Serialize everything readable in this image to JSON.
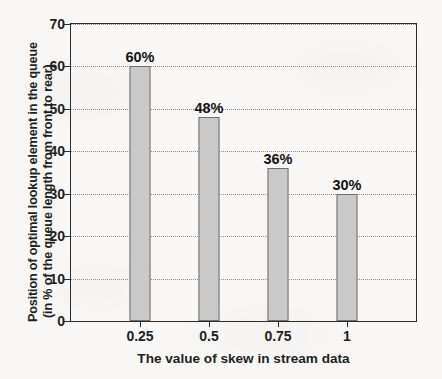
{
  "chart_data": {
    "type": "bar",
    "title": "",
    "categories": [
      "0.25",
      "0.5",
      "0.75",
      "1"
    ],
    "values": [
      60,
      48,
      36,
      30
    ],
    "data_labels": [
      "60%",
      "48%",
      "36%",
      "30%"
    ],
    "xlabel": "The value of skew in stream data",
    "ylabel_line1": "Position of optimal lookup element in the queue",
    "ylabel_line2": "(in % of the queue length from front to rear)",
    "ylim": [
      0,
      70
    ],
    "yticks": [
      0,
      10,
      20,
      30,
      40,
      50,
      60,
      70
    ],
    "ytick_labels": [
      "0",
      "10",
      "20",
      "30",
      "40",
      "50",
      "60",
      "70"
    ],
    "xtick_labels": [
      "0.25",
      "0.5",
      "0.75",
      "1"
    ],
    "grid": "horizontal-dotted",
    "legend": "none",
    "bar_fill_color": "#c9c9c9",
    "bar_edge_color": "#6f6f6f",
    "axis_color": "#2b2b2b",
    "grid_color": "#8d8d8d",
    "background_color": "#f8f7f5"
  }
}
